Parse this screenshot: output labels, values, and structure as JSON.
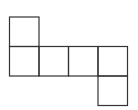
{
  "diagram": {
    "type": "cube-net",
    "stroke_color": "#333333",
    "background": "#ffffff",
    "cell_size": 29.5,
    "origin": {
      "x": 9.5,
      "y": 17
    },
    "squares": [
      {
        "id": "top-left",
        "col": 0,
        "row": 0
      },
      {
        "id": "row-1",
        "col": 0,
        "row": 1
      },
      {
        "id": "row-2",
        "col": 1,
        "row": 1
      },
      {
        "id": "row-3",
        "col": 2,
        "row": 1
      },
      {
        "id": "row-4",
        "col": 3,
        "row": 1
      },
      {
        "id": "bottom-right",
        "col": 3,
        "row": 2
      }
    ]
  }
}
